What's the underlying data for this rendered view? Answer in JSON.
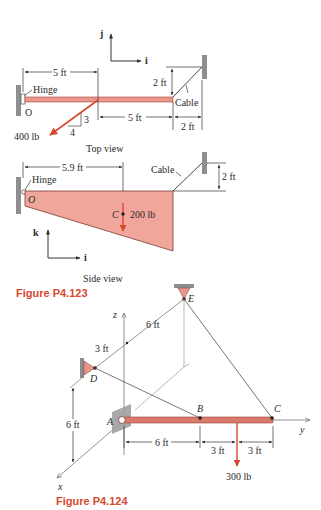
{
  "colors": {
    "member_fill": "#e9968c",
    "member_stroke": "#a84a3e",
    "plate_fill": "#f0a69b",
    "force_arrow": "#d8482e",
    "figure_label": "#d8482e",
    "wall": "#8e8e8e",
    "line": "#333333"
  },
  "figure_p4_123": {
    "caption": "Figure P4.123",
    "top_view": {
      "title": "Top view",
      "unit_vectors": {
        "up": "j",
        "right": "i"
      },
      "hinge_label": "Hinge",
      "origin_label": "O",
      "cable_label": "Cable",
      "force_label": "400 lb",
      "slope_rise": "3",
      "slope_run": "4",
      "dims": {
        "left_span": "5 ft",
        "right_span": "5 ft",
        "cable_offset_x": "2 ft",
        "cable_offset_y": "2 ft"
      }
    },
    "side_view": {
      "title": "Side view",
      "unit_vectors": {
        "up": "k",
        "right": "i"
      },
      "hinge_label": "Hinge",
      "origin_label": "O",
      "cable_label": "Cable",
      "center_label": "C",
      "weight_label": "200 lb",
      "dims": {
        "center_x": "5.9 ft",
        "cable_height": "2 ft"
      }
    }
  },
  "figure_p4_124": {
    "caption": "Figure P4.124",
    "axes": {
      "x": "x",
      "y": "y",
      "z": "z"
    },
    "points": {
      "A": "A",
      "B": "B",
      "C": "C",
      "D": "D",
      "E": "E"
    },
    "force_label": "300 lb",
    "dims": {
      "d_to_z": "3 ft",
      "z_to_e": "6 ft",
      "height": "6 ft",
      "a_to_b": "6 ft",
      "b_to_load": "3 ft",
      "load_to_c": "3 ft"
    }
  }
}
